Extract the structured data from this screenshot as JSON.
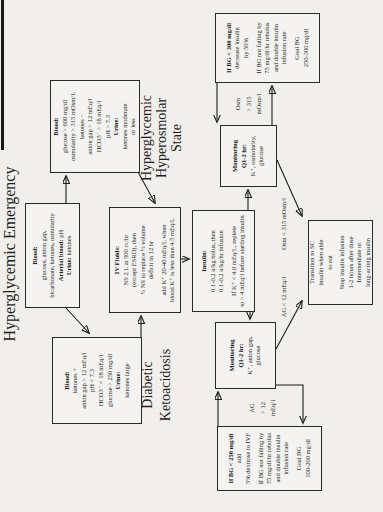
{
  "colors": {
    "page_bg": "#f0efec",
    "ink": "#1d1d1b",
    "box_border": "#2a2a28"
  },
  "title": "Hyperglycemic Emergency",
  "branch_titles": {
    "dka": [
      "Diabetic",
      "Ketoacidosis"
    ],
    "hhs": [
      "Hyperglycemic",
      "Hyperosmolar",
      "State"
    ]
  },
  "boxes": {
    "initial_eval": {
      "lines": [
        {
          "t": "Blood:",
          "b": true
        },
        {
          "t": "glucose, anion gap,"
        },
        {
          "t": "bicarbonate, ketones, osmolarity"
        },
        {
          "pre": "Arterial blood:",
          "t": " pH"
        },
        {
          "pre": "Urine:",
          "t": " ketones"
        }
      ]
    },
    "hhs_criteria": {
      "lines": [
        {
          "t": "Blood:",
          "b": true
        },
        {
          "t": "glucose > 600 mg/dl"
        },
        {
          "t": "osmolarity > 315 mOsm/L"
        },
        {
          "t": "ketones −"
        },
        {
          "t": "anion gap > 12 mEq/l"
        },
        {
          "t": "HCO3⁻ > 18 mEq/l"
        },
        {
          "t": "pH > 7.3"
        },
        {
          "t": "Urine:",
          "b": true
        },
        {
          "t": "ketones moderate"
        },
        {
          "t": "or less"
        }
      ]
    },
    "dka_criteria": {
      "lines": [
        {
          "t": "Blood:",
          "b": true
        },
        {
          "t": "ketones +"
        },
        {
          "t": "anion gap > 12 mEq/l"
        },
        {
          "t": "pH < 7.3"
        },
        {
          "t": "HCO3⁻ < 18 mEq/l"
        },
        {
          "t": "glucose > 250 mg/dl"
        },
        {
          "t": "Urine:",
          "b": true
        },
        {
          "t": "ketones large"
        }
      ]
    },
    "iv_fluids": {
      "lines": [
        {
          "t": "IV Fluids:",
          "b": true
        },
        {
          "t": "NS  2 L at 500 cc/hr"
        },
        {
          "t": "(except ESRD), then"
        },
        {
          "t": "½ NS to replace ½ volume"
        },
        {
          "t": "deficit in 12 hr"
        },
        {
          "t": ""
        },
        {
          "t": "add K⁺ 20-40 mEq/L when"
        },
        {
          "t": "blood K⁺ is less than 4.5 mEq/L"
        }
      ]
    },
    "insulin": {
      "lines": [
        {
          "t": "Insulin:",
          "b": true
        },
        {
          "t": "0.1-0.2 u/kg bolus, then"
        },
        {
          "t": "0.1-0.2 u/kg/hr infusion"
        },
        {
          "t": ""
        },
        {
          "t": "If K⁺ < 4.0 mEq/L, replete"
        },
        {
          "t": "to > 4 mEq/l before starting insulin"
        }
      ]
    },
    "hhs_monitoring": {
      "lines": [
        {
          "t": "Monitoring",
          "b": true
        },
        {
          "t": "Q1-2 hr:",
          "b": true
        },
        {
          "t": "K⁺, osmolarity,"
        },
        {
          "t": "glucose"
        }
      ]
    },
    "dka_monitoring": {
      "lines": [
        {
          "t": "Monitoring",
          "b": true
        },
        {
          "t": "Q1-2 hr:",
          "b": true
        },
        {
          "t": "K⁺, anion gap,"
        },
        {
          "t": "glucose"
        }
      ]
    },
    "hhs_outcome": {
      "lines": [
        {
          "t": "If BG < 300 mg/dl",
          "b": true
        },
        {
          "t": "decrease insulin"
        },
        {
          "t": "by 50%"
        },
        {
          "t": ""
        },
        {
          "t": "If BG not falling by"
        },
        {
          "t": "75 mg/dl/hr rebolus"
        },
        {
          "t": "and double insulin"
        },
        {
          "t": "infusion rate"
        },
        {
          "t": ""
        },
        {
          "t": "Goal BG"
        },
        {
          "t": "250-300 mg/dl"
        }
      ]
    },
    "dka_outcome": {
      "lines": [
        {
          "t": "If BG < 250 mg/dl",
          "b": true
        },
        {
          "t": "add"
        },
        {
          "t": "5% dextrose to IVF"
        },
        {
          "t": ""
        },
        {
          "t": "If BG not falling by"
        },
        {
          "t": "75 mg/dl/hr rebolus"
        },
        {
          "t": "and double insulin"
        },
        {
          "t": "infusion rate"
        },
        {
          "t": ""
        },
        {
          "t": "Goal BG"
        },
        {
          "t": "100-200 mg/dl"
        }
      ]
    },
    "transition": {
      "lines": [
        {
          "t": "Transition to SC"
        },
        {
          "t": "insulin when able"
        },
        {
          "t": "to eat"
        },
        {
          "t": ""
        },
        {
          "t": "Stop insulin infusion"
        },
        {
          "t": "1-2 hours after dose"
        },
        {
          "t": "Intermediate or"
        },
        {
          "t": "long-acting insulin"
        }
      ]
    },
    "edge_labels_note": null
  },
  "edge_labels": {
    "osm_high": [
      "Osm",
      "> 315",
      "mOsm/l"
    ],
    "osm_low": "Osm < 315 mOsm/l",
    "ag_high": [
      "AG",
      "> 12",
      "mEq/l"
    ],
    "ag_low": "AG < 12 mEq/l"
  }
}
